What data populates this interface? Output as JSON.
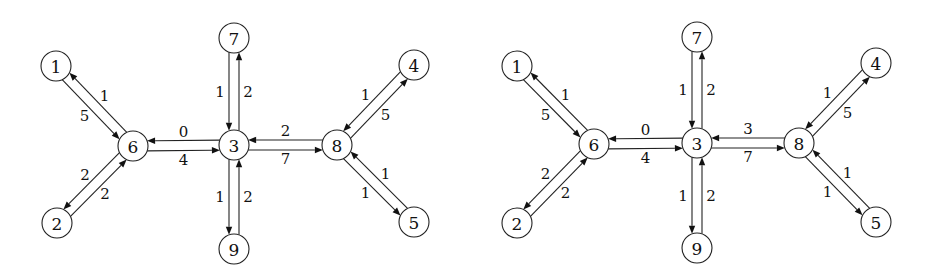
{
  "figure": {
    "node_radius": 15,
    "edge_offset": 5,
    "label_offset": 14,
    "graphs": [
      {
        "id": "left-graph",
        "nodes": [
          {
            "id": "1",
            "label": "1",
            "x": 56,
            "y": 66
          },
          {
            "id": "2",
            "label": "2",
            "x": 57,
            "y": 223
          },
          {
            "id": "3",
            "label": "3",
            "x": 234,
            "y": 145
          },
          {
            "id": "4",
            "label": "4",
            "x": 414,
            "y": 65
          },
          {
            "id": "5",
            "label": "5",
            "x": 414,
            "y": 222
          },
          {
            "id": "6",
            "label": "6",
            "x": 133,
            "y": 146
          },
          {
            "id": "7",
            "label": "7",
            "x": 234,
            "y": 38
          },
          {
            "id": "8",
            "label": "8",
            "x": 337,
            "y": 145
          },
          {
            "id": "9",
            "label": "9",
            "x": 234,
            "y": 249
          }
        ],
        "edges": [
          {
            "from": "6",
            "to": "1",
            "weight": "1"
          },
          {
            "from": "1",
            "to": "6",
            "weight": "5"
          },
          {
            "from": "6",
            "to": "2",
            "weight": "2"
          },
          {
            "from": "2",
            "to": "6",
            "weight": "2"
          },
          {
            "from": "3",
            "to": "6",
            "weight": "0"
          },
          {
            "from": "6",
            "to": "3",
            "weight": "4"
          },
          {
            "from": "7",
            "to": "3",
            "weight": "1"
          },
          {
            "from": "3",
            "to": "7",
            "weight": "2"
          },
          {
            "from": "3",
            "to": "9",
            "weight": "1"
          },
          {
            "from": "9",
            "to": "3",
            "weight": "2"
          },
          {
            "from": "8",
            "to": "3",
            "weight": "2"
          },
          {
            "from": "3",
            "to": "8",
            "weight": "7"
          },
          {
            "from": "4",
            "to": "8",
            "weight": "1"
          },
          {
            "from": "8",
            "to": "4",
            "weight": "5"
          },
          {
            "from": "5",
            "to": "8",
            "weight": "1"
          },
          {
            "from": "8",
            "to": "5",
            "weight": "1"
          }
        ]
      },
      {
        "id": "right-graph",
        "nodes": [
          {
            "id": "1",
            "label": "1",
            "x": 517,
            "y": 66
          },
          {
            "id": "2",
            "label": "2",
            "x": 517,
            "y": 223
          },
          {
            "id": "3",
            "label": "3",
            "x": 697,
            "y": 143
          },
          {
            "id": "4",
            "label": "4",
            "x": 876,
            "y": 63
          },
          {
            "id": "5",
            "label": "5",
            "x": 876,
            "y": 222
          },
          {
            "id": "6",
            "label": "6",
            "x": 594,
            "y": 144
          },
          {
            "id": "7",
            "label": "7",
            "x": 697,
            "y": 37
          },
          {
            "id": "8",
            "label": "8",
            "x": 799,
            "y": 143
          },
          {
            "id": "9",
            "label": "9",
            "x": 697,
            "y": 248
          }
        ],
        "edges": [
          {
            "from": "6",
            "to": "1",
            "weight": "1"
          },
          {
            "from": "1",
            "to": "6",
            "weight": "5"
          },
          {
            "from": "6",
            "to": "2",
            "weight": "2"
          },
          {
            "from": "2",
            "to": "6",
            "weight": "2"
          },
          {
            "from": "3",
            "to": "6",
            "weight": "0"
          },
          {
            "from": "6",
            "to": "3",
            "weight": "4"
          },
          {
            "from": "7",
            "to": "3",
            "weight": "1"
          },
          {
            "from": "3",
            "to": "7",
            "weight": "2"
          },
          {
            "from": "3",
            "to": "9",
            "weight": "1"
          },
          {
            "from": "9",
            "to": "3",
            "weight": "2"
          },
          {
            "from": "8",
            "to": "3",
            "weight": "3"
          },
          {
            "from": "3",
            "to": "8",
            "weight": "7"
          },
          {
            "from": "4",
            "to": "8",
            "weight": "1"
          },
          {
            "from": "8",
            "to": "4",
            "weight": "5"
          },
          {
            "from": "5",
            "to": "8",
            "weight": "1"
          },
          {
            "from": "8",
            "to": "5",
            "weight": "1"
          }
        ]
      }
    ]
  }
}
